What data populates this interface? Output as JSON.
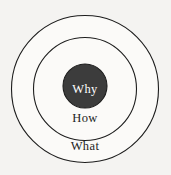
{
  "diagram": {
    "name": "golden-circle",
    "background_color": "#f4f3f1",
    "stroke_color": "#1d1d1d",
    "rings": [
      {
        "id": "what",
        "label": "What",
        "fill_color": "#fbfaf8",
        "text_color": "#1d1d1d",
        "center_x": 85,
        "center_y": 89,
        "radius": 73.5,
        "label_x": 85,
        "label_y": 147
      },
      {
        "id": "how",
        "label": "How",
        "fill_color": "#fbfaf8",
        "text_color": "#1d1d1d",
        "center_x": 85,
        "center_y": 89,
        "radius": 51.5,
        "label_x": 85,
        "label_y": 119
      },
      {
        "id": "why",
        "label": "Why",
        "fill_color": "#3c3c3c",
        "text_color": "#ffffff",
        "center_x": 85,
        "center_y": 86,
        "radius": 22,
        "label_x": 85,
        "label_y": 90
      }
    ]
  }
}
